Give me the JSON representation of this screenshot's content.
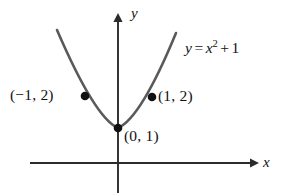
{
  "figure": {
    "background_color": "#ffffff",
    "width": 285,
    "height": 196
  },
  "axes": {
    "x_label": "x",
    "y_label": "y",
    "axis_color": "#2b2b2b",
    "origin_px": {
      "x": 118,
      "y": 163
    },
    "x_axis_start_px": 30,
    "x_axis_end_px": 258,
    "y_axis_top_px": 14,
    "y_axis_bottom_px": 193
  },
  "curve": {
    "color": "#5a5a5a",
    "stroke_width": 2.6,
    "path_d": "M 57 30 Q 95 118 118 128 Q 141 118 176 33"
  },
  "points": [
    {
      "name": "point-left",
      "label": "(−1, 2)",
      "x": -1,
      "y": 2,
      "px": {
        "x": 85,
        "y": 96
      },
      "label_side": "left"
    },
    {
      "name": "point-right",
      "label": "(1, 2)",
      "x": 1,
      "y": 2,
      "px": {
        "x": 152,
        "y": 97
      },
      "label_side": "right"
    },
    {
      "name": "point-vertex",
      "label": "(0, 1)",
      "x": 0,
      "y": 1,
      "px": {
        "x": 118,
        "y": 128
      },
      "label_side": "below-right"
    }
  ],
  "equation": {
    "full_text": "y = x² + 1",
    "lhs": "y",
    "equals": "=",
    "base": "x",
    "exponent": "2",
    "plus": "+",
    "constant": "1"
  },
  "chart_data": {
    "type": "line",
    "title": "",
    "xlabel": "x",
    "ylabel": "y",
    "function": "y = x^2 + 1",
    "series": [
      {
        "name": "y = x^2 + 1",
        "x": [
          -1.6,
          -1.4,
          -1.2,
          -1.0,
          -0.8,
          -0.6,
          -0.4,
          -0.2,
          0.0,
          0.2,
          0.4,
          0.6,
          0.8,
          1.0,
          1.2,
          1.4,
          1.6
        ],
        "values": [
          3.56,
          2.96,
          2.44,
          2.0,
          1.64,
          1.36,
          1.16,
          1.04,
          1.0,
          1.04,
          1.16,
          1.36,
          1.64,
          2.0,
          2.44,
          2.96,
          3.56
        ]
      }
    ],
    "annotated_points": [
      {
        "label": "(−1, 2)",
        "x": -1,
        "y": 2
      },
      {
        "label": "(1, 2)",
        "x": 1,
        "y": 2
      },
      {
        "label": "(0, 1)",
        "x": 0,
        "y": 1
      }
    ],
    "xlim": [
      -1.8,
      2.4
    ],
    "ylim": [
      -0.8,
      4.0
    ],
    "grid": false,
    "legend": "none",
    "annotations": [
      "y = x² + 1"
    ]
  }
}
